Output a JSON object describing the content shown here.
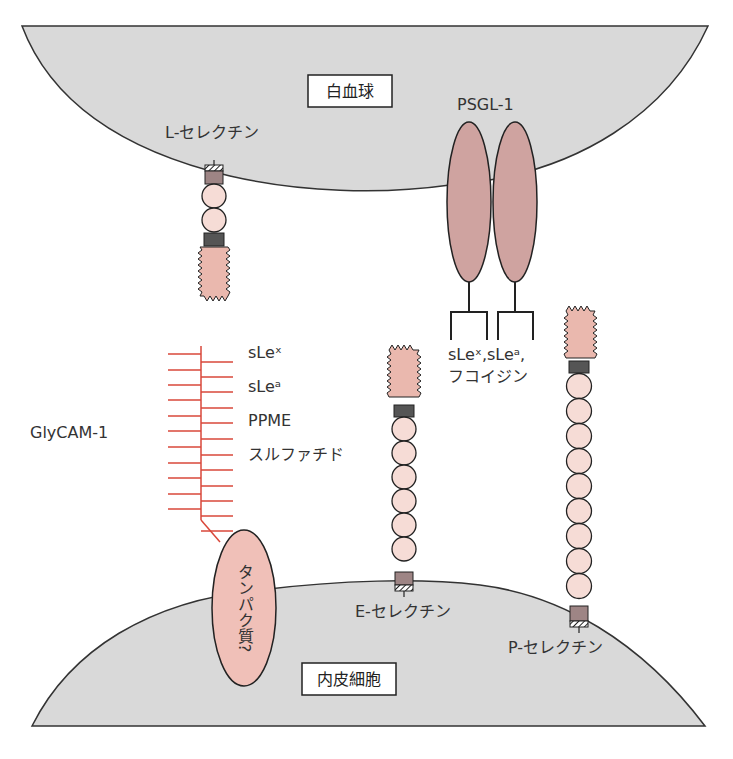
{
  "cells": {
    "leukocyte": {
      "label": "白血球"
    },
    "endothelial": {
      "label": "内皮細胞"
    }
  },
  "molecules": {
    "l_selectin": {
      "label": "L-セレクチン"
    },
    "psgl1": {
      "label": "PSGL-1",
      "ligands_line1": "sLeˣ,sLeᵃ,",
      "ligands_line2": "フコイジン"
    },
    "glycam1": {
      "label": "GlyCAM-1",
      "ligands": [
        "sLeˣ",
        "sLeᵃ",
        "PPME",
        "スルファチド"
      ],
      "protein_label": "タンパク質?"
    },
    "e_selectin": {
      "label": "E-セレクチン"
    },
    "p_selectin": {
      "label": "P-セレクチン"
    }
  },
  "colors": {
    "cell_fill": "#d9d9d9",
    "domain_pink": "#eab8ae",
    "bead_fill": "#f6dcd6",
    "psgl_fill": "#cfa3a0",
    "egf_dark": "#555555",
    "tm_box": "#9e8585",
    "glycam_red": "#d9473a"
  }
}
